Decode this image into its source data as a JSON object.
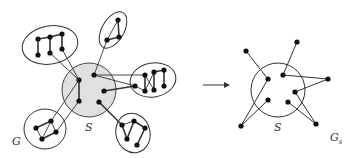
{
  "diagram": {
    "type": "graph-transformation",
    "left_graph": {
      "label": "G",
      "separator_label": "S",
      "separator_fill": "#e0e0e0",
      "stroke_color": "#333333",
      "node_color": "#111111",
      "components": 5
    },
    "arrow": {
      "direction": "right"
    },
    "right_graph": {
      "label_main": "G",
      "label_sub": "s",
      "separator_label": "S"
    }
  }
}
